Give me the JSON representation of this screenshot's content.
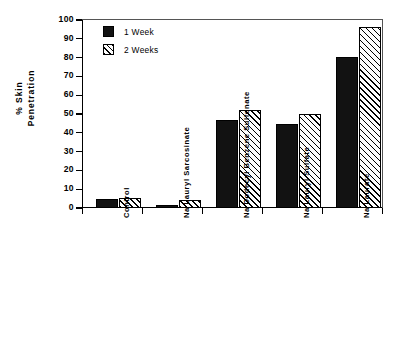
{
  "chart_data": {
    "type": "bar",
    "title": "",
    "xlabel": "",
    "ylabel": "% Skin Penetration",
    "ylabel_line1": "% Skin",
    "ylabel_line2": "Penetration",
    "ylim": [
      0,
      100
    ],
    "ytick_step": 10,
    "yticks": [
      0,
      10,
      20,
      30,
      40,
      50,
      60,
      70,
      80,
      90,
      100
    ],
    "ytick_labels": [
      "0",
      "10",
      "20",
      "30",
      "40",
      "50",
      "60",
      "70",
      "80",
      "90",
      "100"
    ],
    "grid": false,
    "legend_position": "upper-left-inside",
    "categories": [
      "Control",
      "Na Lauryl Sarcosinate",
      "Na Dodecyl Benzene Sulfonate",
      "Na Lauryl Sulfate",
      "Na Laurate"
    ],
    "series": [
      {
        "name": "1 Week",
        "fill": "solid-black",
        "color": "#121212",
        "values": [
          5.0,
          1.5,
          47.0,
          44.5,
          80.5
        ]
      },
      {
        "name": "2 Weeks",
        "fill": "diagonal-hatch",
        "color": "#ffffff",
        "values": [
          5.5,
          4.0,
          52.0,
          50.0,
          96.5
        ]
      }
    ]
  },
  "legend": {
    "items": [
      {
        "label": "1 Week"
      },
      {
        "label": "2 Weeks"
      }
    ]
  },
  "colors": {
    "axis": "#000000",
    "series1": "#121212",
    "series2": "#ffffff",
    "background": "#ffffff"
  }
}
